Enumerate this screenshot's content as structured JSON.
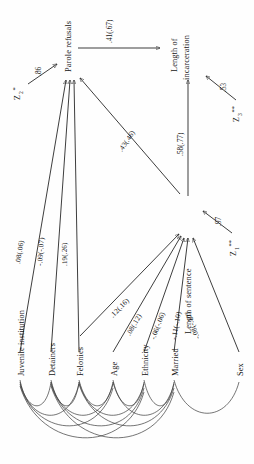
{
  "figure": {
    "type": "path-diagram",
    "orientation": "rotated-90-counterclockwise",
    "background": "#ffffff",
    "ink": "#1b1b1b"
  },
  "nodes": {
    "parole_refusals": "Parole refusals",
    "length_of_sentence": "Length of sentence",
    "length_of_incarceration_l1": "Length of",
    "length_of_incarceration_l2": "incarceration",
    "juvenile_institution": "Juvenile institution",
    "detainers": "Detainers",
    "felonies": "Felonies",
    "age": "Age",
    "ethnicity": "Ethnicity",
    "married": "Married",
    "sex": "Sex"
  },
  "disturbances": {
    "z1": {
      "name": "Z",
      "sub": "1",
      "stars": "**",
      "coefficient": ".97"
    },
    "z2": {
      "name": "Z",
      "sub": "2",
      "stars": "*",
      "coefficient": ".86"
    },
    "z3": {
      "name": "Z",
      "sub": "3",
      "stars": "**",
      "coefficient": ".53"
    }
  },
  "paths": [
    {
      "from": "parole_refusals",
      "to": "length_of_incarceration",
      "coefficient": ".41(.67)"
    },
    {
      "from": "length_of_sentence",
      "to": "length_of_incarceration",
      "coefficient": ".58(.77)"
    },
    {
      "from": "length_of_sentence",
      "to": "parole_refusals",
      "coefficient": ".43(.46)"
    },
    {
      "from": "juvenile_institution",
      "to": "parole_refusals",
      "coefficient": ".08(.06)"
    },
    {
      "from": "detainers",
      "to": "parole_refusals",
      "coefficient": "-.09(-.07)"
    },
    {
      "from": "felonies",
      "to": "parole_refusals",
      "coefficient": ".19(.26)"
    },
    {
      "from": "felonies",
      "to": "length_of_sentence",
      "coefficient": ".12(.16)"
    },
    {
      "from": "age",
      "to": "length_of_sentence",
      "coefficient": ".08(.12)"
    },
    {
      "from": "ethnicity",
      "to": "length_of_sentence",
      "coefficient": "-.06(-.06)"
    },
    {
      "from": "married",
      "to": "length_of_sentence",
      "coefficient": "-.11(-.10)"
    },
    {
      "from": "sex",
      "to": "length_of_sentence",
      "coefficient": "-.08(-.10)"
    }
  ],
  "correlations": {
    "note": "curved double arcs connecting the seven exogenous variables",
    "variables": [
      "Juvenile institution",
      "Detainers",
      "Felonies",
      "Age",
      "Ethnicity",
      "Married",
      "Sex"
    ]
  }
}
